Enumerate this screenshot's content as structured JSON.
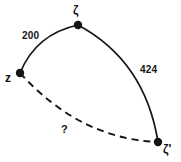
{
  "figure": {
    "type": "geometric-diagram",
    "background_color": "#ffffff",
    "stroke_color": "#151515"
  },
  "vertices": [
    {
      "id": "zeta-top",
      "label": "ζ",
      "x": 78,
      "y": 25,
      "label_x": 73,
      "label_y": 4
    },
    {
      "id": "z-left",
      "label": "z",
      "x": 20,
      "y": 73,
      "label_x": 5,
      "label_y": 72
    },
    {
      "id": "zeta-prime-bottom-right",
      "label": "ζ'",
      "x": 158,
      "y": 142,
      "label_x": 163,
      "label_y": 143
    }
  ],
  "edges": [
    {
      "id": "edge-z-zeta",
      "from": "z-left",
      "to": "zeta-top",
      "style": "solid",
      "label": "200",
      "label_x": 22,
      "label_y": 31
    },
    {
      "id": "edge-zeta-zetaprime",
      "from": "zeta-top",
      "to": "zeta-prime-bottom-right",
      "style": "solid",
      "label": "424",
      "label_x": 140,
      "label_y": 65
    },
    {
      "id": "edge-z-zetaprime",
      "from": "z-left",
      "to": "zeta-prime-bottom-right",
      "style": "dashed",
      "label": "?",
      "label_x": 61,
      "label_y": 124
    }
  ],
  "paths": {
    "arc_z_zeta": "M 20,73 Q 36,34 78,25",
    "arc_zeta_zetaprime": "M 78,25 Q 145,61 158,142",
    "arc_z_zetaprime_dashed": "M 20,73 Q 80,139 158,142"
  }
}
